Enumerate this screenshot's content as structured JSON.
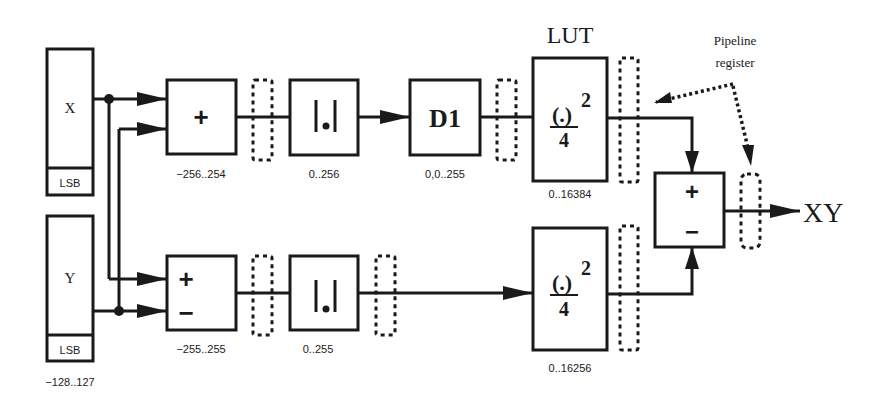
{
  "diagram": {
    "title_lut": "LUT",
    "annotation": {
      "line1": "Pipeline",
      "line2": "register"
    },
    "output_label": "XY",
    "inputs": [
      {
        "name": "X",
        "sub": "LSB",
        "range": ""
      },
      {
        "name": "Y",
        "sub": "LSB",
        "range": "−128..127"
      }
    ],
    "top_path": {
      "adder": {
        "symbol": "+",
        "range": "−256..254"
      },
      "abs": {
        "symbol": "|.|",
        "range": "0..256"
      },
      "d1": {
        "symbol": "D1",
        "range": "0,0..255"
      },
      "lut": {
        "num": "(.)",
        "exp": "2",
        "den": "4",
        "range": "0..16384"
      }
    },
    "bottom_path": {
      "sub": {
        "plus": "+",
        "minus": "−",
        "range": "−255..255"
      },
      "abs": {
        "symbol": "|.|",
        "range": "0..255"
      },
      "lut": {
        "num": "(.)",
        "exp": "2",
        "den": "4",
        "range": "0..16256"
      }
    },
    "final": {
      "plus": "+",
      "minus": "−"
    }
  }
}
